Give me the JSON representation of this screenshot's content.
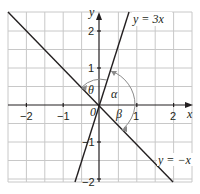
{
  "diagram": {
    "type": "coordinate-graph",
    "axes": {
      "x_label": "x",
      "y_label": "y",
      "origin_label": "0",
      "x_ticks": [
        {
          "value": -2,
          "label": "−2"
        },
        {
          "value": -1,
          "label": "−1"
        },
        {
          "value": 1,
          "label": "1"
        },
        {
          "value": 2,
          "label": "2"
        }
      ],
      "y_ticks": [
        {
          "value": 2,
          "label": "2"
        },
        {
          "value": 1,
          "label": "1"
        },
        {
          "value": -1,
          "label": "−1"
        },
        {
          "value": -2,
          "label": "−2"
        }
      ],
      "range": {
        "x": [
          -2.5,
          2.5
        ],
        "y": [
          -2.05,
          2.55
        ]
      },
      "grid_step": 0.5
    },
    "lines": [
      {
        "equation": "y = 3x",
        "label": "y = 3x",
        "slope": 3
      },
      {
        "equation": "y = −x",
        "label": "y = −x",
        "slope": -1
      }
    ],
    "angles": [
      {
        "symbol": "θ",
        "description": "angle between y = 3x and y = −x (upper)"
      },
      {
        "symbol": "α",
        "description": "angle from positive x-axis to y = 3x"
      },
      {
        "symbol": "β",
        "description": "angle from positive x-axis to y = −x (clockwise)"
      }
    ],
    "colors": {
      "line": "#231f20",
      "grid": "#c8c8c8",
      "arc": "#8a8a8a"
    }
  }
}
